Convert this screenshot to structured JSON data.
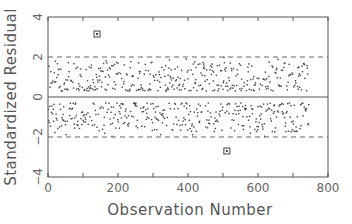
{
  "chart_data": {
    "type": "scatter",
    "title": "",
    "xlabel": "Observation Number",
    "ylabel": "Standardized Residual",
    "xlim": [
      0,
      800
    ],
    "ylim": [
      -4,
      4
    ],
    "xticks": [
      0,
      200,
      400,
      600,
      800
    ],
    "xticks_minor": [
      100,
      300,
      500,
      700
    ],
    "yticks": [
      -4,
      -2,
      0,
      2,
      4
    ],
    "grid": false,
    "legend": null,
    "reference_lines": [
      {
        "y": 0,
        "style": "solid"
      },
      {
        "y": 2,
        "style": "dashed"
      },
      {
        "y": -2,
        "style": "dashed"
      }
    ],
    "n_observations": 745,
    "point_summary": "Residuals split into two bands: positive values mostly 0.3–1.8, negative values mostly -0.3 to -1.9; nearly all within ±2",
    "outliers": [
      {
        "x": 140,
        "y": 3.15,
        "marker": "square"
      },
      {
        "x": 511,
        "y": -2.7,
        "marker": "square"
      }
    ],
    "colors": {
      "points": "#444444",
      "axes": "#555555",
      "reference": "#666666"
    }
  }
}
